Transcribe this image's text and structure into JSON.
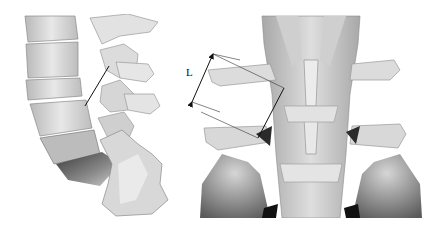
{
  "figure": {
    "panels": [
      {
        "id": "left",
        "view": "lateral lumbar spine with sacrum"
      },
      {
        "id": "right",
        "view": "posterior lumbar spine with pelvis"
      }
    ],
    "measurement": {
      "label": "L",
      "arrow": "double-headed"
    },
    "colors": {
      "bone_light": "#e6e6e6",
      "bone_mid": "#c4c4c4",
      "bone_dark": "#7a7a7a",
      "shadow": "#2a2a2a",
      "line": "#111111",
      "background": "#ffffff"
    }
  }
}
